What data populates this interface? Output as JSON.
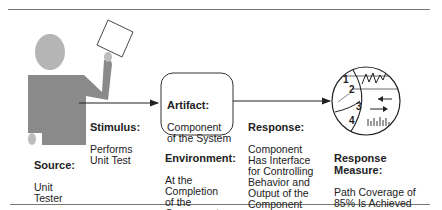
{
  "diagram": {
    "source": {
      "title": "Source:",
      "text": "Unit\nTester",
      "icon": "person-holding-paper-icon"
    },
    "stimulus": {
      "title": "Stimulus:",
      "text": "Performs\nUnit Test"
    },
    "artifact": {
      "title": "Artifact:",
      "text": "Component\nof the System"
    },
    "environment": {
      "title": "Environment:",
      "text": "At the\nCompletion\nof the\nComponent"
    },
    "response": {
      "title": "Response:",
      "text": "Component\nHas Interface\nfor Controlling\nBehavior and\nOutput of the\nComponent\nIs Observable"
    },
    "response_measure": {
      "title": "Response\nMeasure:",
      "text": "Path Coverage of\n85% Is Achieved\nwithin Three Hours",
      "icon": "measurement-gauge-icon",
      "gauge_numbers": [
        "1",
        "2",
        "3",
        "4"
      ]
    },
    "colors": {
      "figure": "#8a8a8a",
      "head": "#b5b5b5",
      "line": "#222222"
    }
  }
}
